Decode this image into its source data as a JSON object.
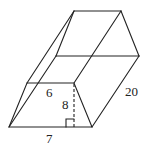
{
  "figure": {
    "type": "trapezoidal prism",
    "labels": {
      "top_base": "6",
      "height": "8",
      "bottom_base": "7",
      "length": "20"
    },
    "colors": {
      "stroke": "#222222",
      "background": "#ffffff"
    }
  }
}
